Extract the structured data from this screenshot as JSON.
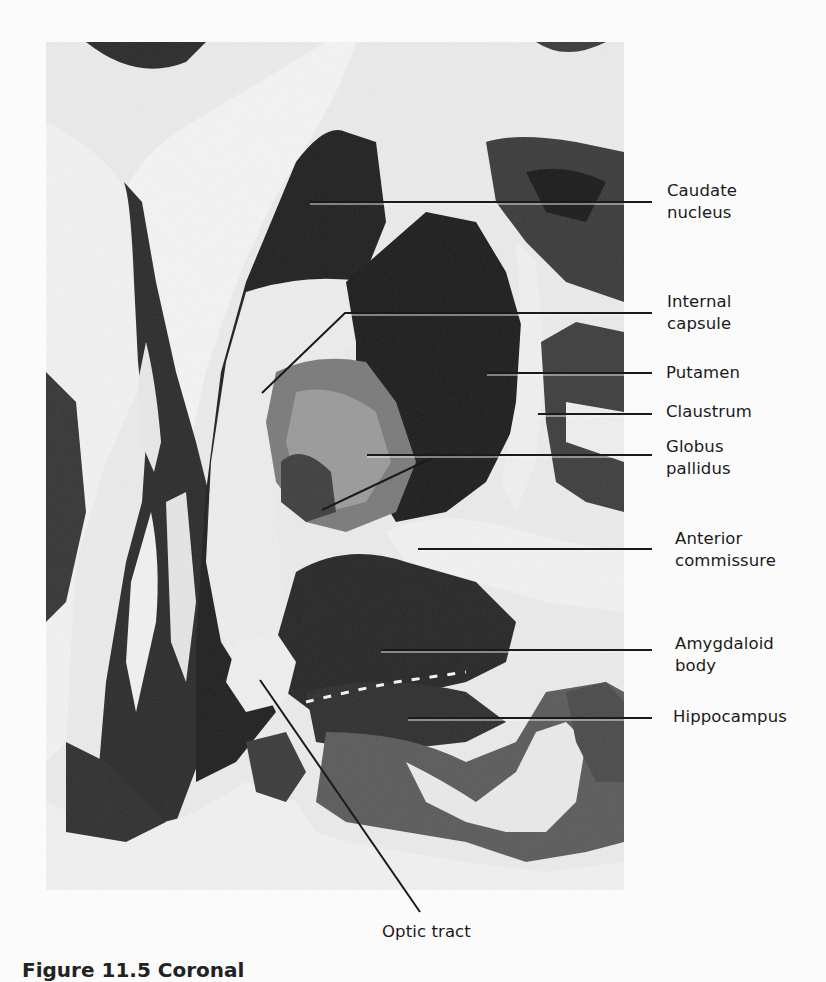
{
  "figure": {
    "caption": "Figure 11.5  Coronal"
  },
  "labels": [
    {
      "id": "caudate-nucleus",
      "text": "Caudate\nnucleus",
      "x": 667,
      "y": 180
    },
    {
      "id": "internal-capsule",
      "text": "Internal\ncapsule",
      "x": 667,
      "y": 291
    },
    {
      "id": "putamen",
      "text": "Putamen",
      "x": 666,
      "y": 362
    },
    {
      "id": "claustrum",
      "text": "Claustrum",
      "x": 666,
      "y": 401
    },
    {
      "id": "globus-pallidus",
      "text": "Globus\npallidus",
      "x": 666,
      "y": 436
    },
    {
      "id": "anterior-commissure",
      "text": "Anterior\ncommissure",
      "x": 675,
      "y": 528
    },
    {
      "id": "amygdaloid-body",
      "text": "Amygdaloid\nbody",
      "x": 675,
      "y": 633
    },
    {
      "id": "hippocampus",
      "text": "Hippocampus",
      "x": 673,
      "y": 706
    },
    {
      "id": "optic-tract",
      "text": "Optic tract",
      "x": 382,
      "y": 921
    }
  ],
  "colors": {
    "white_matter": "#ececec",
    "gray_matter": "#3a3a3a",
    "dark_nucleus": "#1e1e1e",
    "leader_line": "#1a1a1a",
    "background": "#fbfbfb"
  }
}
